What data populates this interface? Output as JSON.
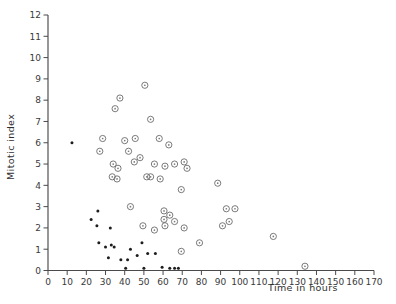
{
  "chart_data": {
    "type": "scatter",
    "title": "",
    "xlabel": "Time in hours",
    "ylabel": "Mitotic index",
    "xlim": [
      0,
      170
    ],
    "ylim": [
      0,
      12
    ],
    "xticks": [
      0,
      10,
      20,
      30,
      40,
      50,
      60,
      70,
      80,
      90,
      100,
      110,
      120,
      130,
      140,
      150,
      160,
      170
    ],
    "yticks": [
      0,
      1,
      2,
      3,
      4,
      5,
      6,
      7,
      8,
      9,
      10,
      11,
      12
    ],
    "grid": false,
    "legend": null,
    "series": [
      {
        "name": "open-circle",
        "marker": "open-circle",
        "color": "#6b6b6b",
        "points": [
          [
            28.5,
            6.2
          ],
          [
            27.0,
            5.6
          ],
          [
            35.0,
            7.6
          ],
          [
            37.5,
            8.1
          ],
          [
            50.5,
            8.7
          ],
          [
            40.0,
            6.1
          ],
          [
            45.5,
            6.2
          ],
          [
            53.5,
            7.1
          ],
          [
            58.0,
            6.2
          ],
          [
            63.0,
            5.9
          ],
          [
            34.0,
            5.0
          ],
          [
            36.5,
            4.8
          ],
          [
            33.5,
            4.4
          ],
          [
            36.0,
            4.3
          ],
          [
            42.0,
            5.6
          ],
          [
            45.0,
            5.1
          ],
          [
            48.0,
            5.3
          ],
          [
            51.5,
            4.4
          ],
          [
            53.5,
            4.4
          ],
          [
            55.5,
            5.0
          ],
          [
            58.5,
            4.3
          ],
          [
            61.0,
            4.9
          ],
          [
            66.0,
            5.0
          ],
          [
            71.0,
            5.1
          ],
          [
            72.5,
            4.8
          ],
          [
            43.0,
            3.0
          ],
          [
            69.5,
            3.8
          ],
          [
            60.5,
            2.8
          ],
          [
            63.5,
            2.6
          ],
          [
            60.5,
            2.4
          ],
          [
            66.0,
            2.3
          ],
          [
            61.0,
            2.1
          ],
          [
            71.0,
            2.0
          ],
          [
            49.5,
            2.1
          ],
          [
            55.5,
            1.9
          ],
          [
            69.5,
            0.9
          ],
          [
            79.0,
            1.3
          ],
          [
            88.5,
            4.1
          ],
          [
            93.0,
            2.9
          ],
          [
            97.5,
            2.9
          ],
          [
            91.0,
            2.1
          ],
          [
            94.5,
            2.3
          ],
          [
            117.5,
            1.6
          ],
          [
            134.0,
            0.2
          ]
        ]
      },
      {
        "name": "filled-dot",
        "marker": "filled-dot",
        "color": "#1d1d1d",
        "points": [
          [
            12.5,
            6.0
          ],
          [
            26.0,
            2.8
          ],
          [
            22.5,
            2.4
          ],
          [
            25.5,
            2.1
          ],
          [
            32.5,
            2.0
          ],
          [
            26.5,
            1.3
          ],
          [
            30.0,
            1.1
          ],
          [
            33.0,
            1.2
          ],
          [
            34.5,
            1.1
          ],
          [
            43.0,
            1.0
          ],
          [
            49.0,
            1.3
          ],
          [
            31.5,
            0.6
          ],
          [
            38.0,
            0.5
          ],
          [
            41.5,
            0.5
          ],
          [
            46.5,
            0.7
          ],
          [
            52.0,
            0.8
          ],
          [
            56.0,
            0.8
          ],
          [
            40.5,
            0.1
          ],
          [
            50.0,
            0.1
          ],
          [
            59.5,
            0.15
          ],
          [
            63.5,
            0.1
          ],
          [
            66.0,
            0.1
          ],
          [
            68.0,
            0.1
          ]
        ]
      }
    ]
  },
  "axes": {
    "x_label": "Time in hours",
    "y_label": "Mitotic index"
  }
}
